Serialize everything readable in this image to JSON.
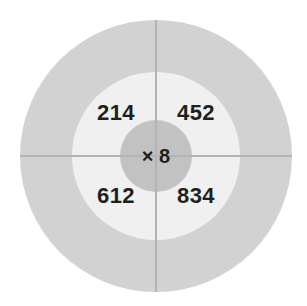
{
  "figure": {
    "center_operator": "× 8"
  },
  "quadrants": {
    "top_left": "214",
    "top_right": "452",
    "bottom_left": "612",
    "bottom_right": "834"
  },
  "colors": {
    "background": "#ffffff",
    "outer_ring": "#d2d2d2",
    "middle_ring": "#f0f0f0",
    "center_hub": "#c2c2c2",
    "axis_line": "#b3b3b3",
    "text": "#1f1f1f"
  },
  "chart_data": {
    "type": "pie",
    "xlabel": "",
    "ylabel": "",
    "legend": "none",
    "grid": false,
    "rings": [
      {
        "name": "outer-ring",
        "radius": 136,
        "color": "#d2d2d2",
        "labels": []
      },
      {
        "name": "middle-ring",
        "radius": 84,
        "color": "#f0f0f0",
        "labels": [
          "214",
          "452",
          "612",
          "834"
        ]
      },
      {
        "name": "center-hub",
        "radius": 36,
        "color": "#c2c2c2",
        "labels": [
          "× 8"
        ]
      }
    ],
    "center": {
      "x": 156,
      "y": 156
    },
    "categories": [
      "top-left",
      "top-right",
      "bottom-left",
      "bottom-right"
    ],
    "values": [
      214,
      452,
      612,
      834
    ],
    "operator": "×",
    "multiplier": 8,
    "dividers": [
      "horizontal",
      "vertical"
    ]
  }
}
